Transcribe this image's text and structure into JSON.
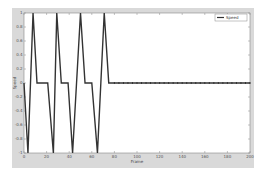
{
  "chart_data": {
    "type": "line",
    "title": "",
    "xlabel": "Frame",
    "ylabel": "Speed",
    "xlim": [
      0,
      200
    ],
    "ylim": [
      -1,
      1
    ],
    "xticks": [
      0,
      20,
      40,
      60,
      80,
      100,
      120,
      140,
      160,
      180,
      200
    ],
    "yticks": [
      -1,
      -0.8,
      -0.6,
      -0.4,
      -0.2,
      0,
      0.2,
      0.4,
      0.6,
      0.8,
      1
    ],
    "grid": false,
    "legend_position": "upper right",
    "series": [
      {
        "name": "Speed",
        "color": "#333333",
        "x": [
          0,
          3.5,
          8,
          11.5,
          21,
          26,
          29,
          33,
          39,
          43,
          50,
          54,
          60,
          65,
          71,
          75,
          200
        ],
        "y": [
          0,
          -1,
          1,
          0,
          0,
          -1,
          1,
          0,
          0,
          -1,
          1,
          0,
          0,
          -1,
          1,
          0,
          0
        ]
      }
    ]
  },
  "plot": {
    "left": 24,
    "top": 13,
    "right": 250,
    "bottom": 153,
    "background": "#ffffff",
    "figure_background": "#d9d9d9"
  }
}
